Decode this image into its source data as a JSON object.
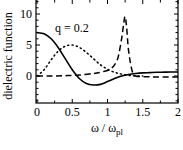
{
  "chart_data": {
    "type": "line",
    "title": "",
    "annotation": "q = 0.2",
    "xlabel": "ω / ω",
    "xlabel_sub": "pl",
    "ylabel": "dielectric function",
    "xlim": [
      0,
      2
    ],
    "ylim": [
      -3,
      12
    ],
    "xticks": [
      {
        "value": 0,
        "label": "0"
      },
      {
        "value": 0.5,
        "label": "0.5"
      },
      {
        "value": 1,
        "label": "1"
      },
      {
        "value": 1.5,
        "label": "1.5"
      },
      {
        "value": 2,
        "label": "2"
      }
    ],
    "yticks": [
      {
        "value": 0,
        "label": "0"
      },
      {
        "value": 5,
        "label": "5"
      },
      {
        "value": 10,
        "label": "10"
      }
    ],
    "grid": false,
    "legend": null,
    "series": [
      {
        "name": "solid",
        "style": "solid",
        "x": [
          0,
          0.1,
          0.2,
          0.3,
          0.4,
          0.5,
          0.6,
          0.7,
          0.8,
          0.9,
          1.0,
          1.1,
          1.2,
          1.3,
          1.4,
          1.5,
          1.6,
          1.7,
          1.8,
          1.9,
          2.0
        ],
        "values": [
          7.0,
          6.8,
          6.0,
          4.6,
          2.8,
          1.0,
          -0.4,
          -1.2,
          -1.45,
          -1.35,
          -0.9,
          -0.4,
          0.0,
          0.25,
          0.4,
          0.5,
          0.55,
          0.6,
          0.62,
          0.64,
          0.65
        ]
      },
      {
        "name": "dotted",
        "style": "dotted",
        "x": [
          0,
          0.1,
          0.2,
          0.3,
          0.4,
          0.5,
          0.6,
          0.7,
          0.8,
          0.9,
          1.0,
          1.1,
          1.2,
          1.3,
          1.4,
          1.5
        ],
        "values": [
          0.0,
          1.0,
          2.6,
          4.0,
          4.8,
          5.0,
          4.6,
          3.8,
          2.8,
          1.8,
          1.1,
          0.6,
          0.3,
          0.1,
          0.0,
          0.0
        ]
      },
      {
        "name": "dashed",
        "style": "dashed",
        "x": [
          0,
          0.2,
          0.4,
          0.6,
          0.8,
          0.9,
          1.0,
          1.05,
          1.1,
          1.15,
          1.2,
          1.23,
          1.25,
          1.27,
          1.3,
          1.35,
          1.4,
          1.5,
          1.7,
          2.0
        ],
        "values": [
          0.0,
          0.0,
          0.05,
          0.15,
          0.4,
          0.6,
          0.9,
          1.2,
          1.8,
          3.0,
          6.0,
          8.5,
          9.6,
          8.0,
          4.0,
          0.8,
          0.0,
          -0.1,
          -0.15,
          -0.15
        ]
      }
    ]
  },
  "colors": {
    "line": "#000000",
    "background": "#ffffff"
  }
}
